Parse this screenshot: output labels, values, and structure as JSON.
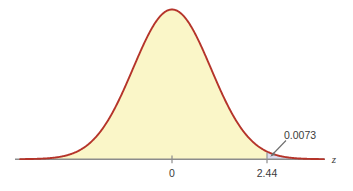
{
  "chart_data": {
    "type": "area",
    "title": "",
    "subtitle": "",
    "xlabel": "z",
    "ylabel": "",
    "grid": false,
    "legend": null,
    "distribution": "standard normal",
    "mean": 0,
    "sd": 1,
    "xlim": [
      -3.9,
      3.9
    ],
    "ylim": [
      0,
      0.42
    ],
    "x_tick_labels": [
      "0",
      "2.44"
    ],
    "x_tick_values": [
      0,
      2.44
    ],
    "annotations": [
      {
        "name": "tail-area-label",
        "text": "0.0073",
        "value": 0.0073,
        "points_to_z": 2.44,
        "description": "area of right tail beyond z = 2.44"
      }
    ],
    "regions": [
      {
        "name": "body-area",
        "from_z": -3.9,
        "to_z": 2.44,
        "fill": "#faf6c8"
      },
      {
        "name": "tail-area",
        "from_z": 2.44,
        "to_z": 3.9,
        "fill": "#dcdcee",
        "value": 0.0073
      }
    ],
    "curve_color": "#b5342a",
    "axis_color": "#8c8c8c"
  },
  "axis": {
    "name": "z",
    "tick_zero_label": "0",
    "tick_cut_label": "2.44"
  },
  "annotation": {
    "tail_probability": "0.0073"
  },
  "colors": {
    "curve": "#b5342a",
    "body_fill": "#faf6c8",
    "tail_fill": "#dcdcee",
    "axis": "#8c8c8c",
    "text": "#3b3b3b",
    "background": "#ffffff",
    "cutline": "#9a9a9a",
    "leader": "#6d6d6d"
  }
}
